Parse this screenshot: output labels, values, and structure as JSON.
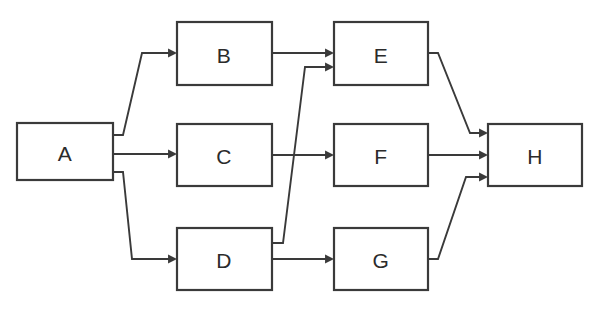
{
  "diagram": {
    "type": "flowchart",
    "canvas": {
      "width": 600,
      "height": 309,
      "background": "#ffffff"
    },
    "style": {
      "node_fill": "#ffffff",
      "node_stroke": "#3a3a3a",
      "node_stroke_width": 2.2,
      "edge_stroke": "#3a3a3a",
      "edge_stroke_width": 1.9,
      "label_color": "#2b2b2b",
      "label_font_size": 21
    },
    "nodes": [
      {
        "id": "A",
        "label": "A",
        "x": 17,
        "y": 123,
        "w": 96,
        "h": 57,
        "cx": 65,
        "cy": 152
      },
      {
        "id": "B",
        "label": "B",
        "x": 177,
        "y": 22,
        "w": 95,
        "h": 63,
        "cx": 224,
        "cy": 54
      },
      {
        "id": "C",
        "label": "C",
        "x": 177,
        "y": 124,
        "w": 95,
        "h": 62,
        "cx": 224,
        "cy": 155
      },
      {
        "id": "D",
        "label": "D",
        "x": 177,
        "y": 228,
        "w": 95,
        "h": 62,
        "cx": 224,
        "cy": 259
      },
      {
        "id": "E",
        "label": "E",
        "x": 334,
        "y": 22,
        "w": 94,
        "h": 63,
        "cx": 381,
        "cy": 54
      },
      {
        "id": "F",
        "label": "F",
        "x": 334,
        "y": 124,
        "w": 94,
        "h": 62,
        "cx": 381,
        "cy": 155
      },
      {
        "id": "G",
        "label": "G",
        "x": 334,
        "y": 228,
        "w": 94,
        "h": 62,
        "cx": 381,
        "cy": 259
      },
      {
        "id": "H",
        "label": "H",
        "x": 488,
        "y": 124,
        "w": 94,
        "h": 62,
        "cx": 535,
        "cy": 155
      }
    ],
    "edges": [
      {
        "id": "A-B",
        "from": "A",
        "to": "B",
        "points": "113,135 123,135 142,53 172,53",
        "arrow": {
          "x": 177,
          "y": 53,
          "dir": "right"
        }
      },
      {
        "id": "A-C",
        "from": "A",
        "to": "C",
        "points": "113,154 172,154",
        "arrow": {
          "x": 177,
          "y": 154,
          "dir": "right"
        }
      },
      {
        "id": "A-D",
        "from": "A",
        "to": "D",
        "points": "113,172 123,172 132,259 172,259",
        "arrow": {
          "x": 177,
          "y": 259,
          "dir": "right"
        }
      },
      {
        "id": "B-E",
        "from": "B",
        "to": "E",
        "points": "272,53 329,53",
        "arrow": {
          "x": 334,
          "y": 53,
          "dir": "right"
        }
      },
      {
        "id": "C-F",
        "from": "C",
        "to": "F",
        "points": "272,155 329,155",
        "arrow": {
          "x": 334,
          "y": 155,
          "dir": "right"
        }
      },
      {
        "id": "D-E",
        "from": "D",
        "to": "E",
        "points": "272,243 283,243 305,67 329,67",
        "arrow": {
          "x": 334,
          "y": 67,
          "dir": "right"
        }
      },
      {
        "id": "D-G",
        "from": "D",
        "to": "G",
        "points": "272,259 329,259",
        "arrow": {
          "x": 334,
          "y": 259,
          "dir": "right"
        }
      },
      {
        "id": "E-H",
        "from": "E",
        "to": "H",
        "points": "428,53 438,53 470,133 483,133",
        "arrow": {
          "x": 488,
          "y": 133,
          "dir": "right"
        }
      },
      {
        "id": "F-H",
        "from": "F",
        "to": "H",
        "points": "428,155 483,155",
        "arrow": {
          "x": 488,
          "y": 155,
          "dir": "right"
        }
      },
      {
        "id": "G-H",
        "from": "G",
        "to": "H",
        "points": "428,259 438,259 466,177 483,177",
        "arrow": {
          "x": 488,
          "y": 177,
          "dir": "right"
        }
      }
    ]
  }
}
